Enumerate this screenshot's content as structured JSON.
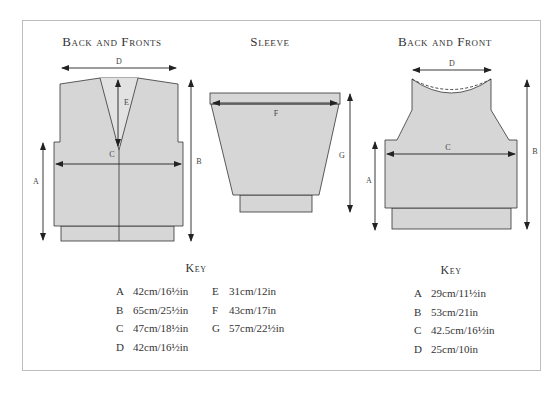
{
  "colors": {
    "fill": "#d6d6d6",
    "stroke": "#333333",
    "border": "#bdbdbd"
  },
  "diagrams": [
    {
      "title": "Back and Fronts",
      "labels": {
        "A": "A",
        "B": "B",
        "C": "C",
        "D": "D",
        "E": "E"
      }
    },
    {
      "title": "Sleeve",
      "labels": {
        "F": "F",
        "G": "G"
      }
    },
    {
      "title": "Back and Front",
      "labels": {
        "A": "A",
        "B": "B",
        "C": "C",
        "D": "D"
      }
    }
  ],
  "keys": [
    {
      "title": "Key",
      "col1": [
        {
          "letter": "A",
          "value": "42cm/16½in"
        },
        {
          "letter": "B",
          "value": "65cm/25½in"
        },
        {
          "letter": "C",
          "value": "47cm/18½in"
        },
        {
          "letter": "D",
          "value": "42cm/16½in"
        }
      ],
      "col2": [
        {
          "letter": "E",
          "value": "31cm/12in"
        },
        {
          "letter": "F",
          "value": "43cm/17in"
        },
        {
          "letter": "G",
          "value": "57cm/22½in"
        }
      ]
    },
    {
      "title": "Key",
      "col1": [
        {
          "letter": "A",
          "value": "29cm/11½in"
        },
        {
          "letter": "B",
          "value": "53cm/21in"
        },
        {
          "letter": "C",
          "value": "42.5cm/16½in"
        },
        {
          "letter": "D",
          "value": "25cm/10in"
        }
      ]
    }
  ]
}
